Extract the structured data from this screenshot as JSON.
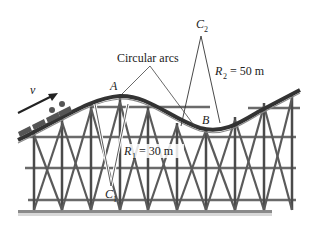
{
  "figure": {
    "labels": {
      "velocity": "v",
      "point_a": "A",
      "point_b": "B",
      "center_1": "C",
      "center_1_sub": "1",
      "center_2": "C",
      "center_2_sub": "2",
      "circular_arcs": "Circular arcs",
      "r1_symbol": "R",
      "r1_sub": "1",
      "r1_value": " = 30 m",
      "r2_symbol": "R",
      "r2_sub": "2",
      "r2_value": " = 50 m"
    },
    "colors": {
      "structure": "#555555",
      "structure_dark": "#3a3a3a",
      "ground": "#8a8a8a",
      "radius_line": "#333333"
    }
  }
}
